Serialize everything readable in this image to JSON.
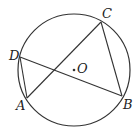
{
  "diagram": {
    "type": "circle-geometry",
    "circle": {
      "center_label": "O",
      "cx": 74,
      "cy": 70,
      "r": 56
    },
    "points": {
      "A": {
        "label": "A",
        "x": 27,
        "y": 98
      },
      "B": {
        "label": "B",
        "x": 122,
        "y": 96
      },
      "C": {
        "label": "C",
        "x": 101,
        "y": 22
      },
      "D": {
        "label": "D",
        "x": 20,
        "y": 57
      }
    },
    "segments": [
      "AC",
      "DB",
      "AD",
      "CB"
    ],
    "colors": {
      "stroke": "#333333",
      "background": "#ffffff"
    }
  }
}
